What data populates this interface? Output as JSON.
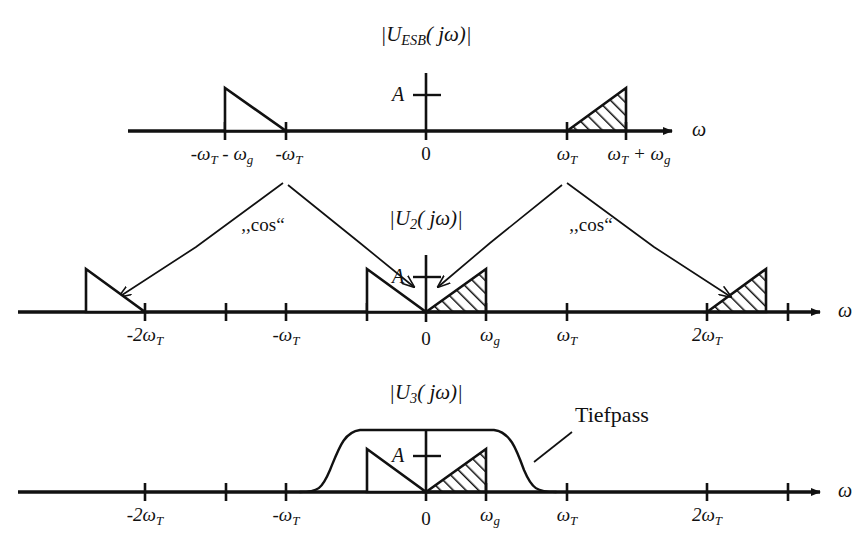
{
  "figure": {
    "kind": "signal-spectra-diagram",
    "omega_symbol": "ω",
    "ink_color": "#111111",
    "background": "#ffffff"
  },
  "panels": [
    {
      "id": "panel-esb",
      "title_main": "|U",
      "title_sub": "ESB",
      "title_tail": "( jω)|",
      "amplitude_label": "A",
      "axis_label": "ω",
      "origin_label": "0",
      "ticks": [
        {
          "label_prefix": "-ω",
          "label_sub": "T",
          "label_suffix": " - ω",
          "label_sub2": "g",
          "text": "-ωT - ωg"
        },
        {
          "label_prefix": "-ω",
          "label_sub": "T",
          "text": "-ωT"
        },
        {
          "text": "0"
        },
        {
          "label_prefix": "ω",
          "label_sub": "T",
          "text": "ωT"
        },
        {
          "label_prefix": "ω",
          "label_sub": "T",
          "label_suffix": " + ω",
          "label_sub2": "g",
          "text": "ωT + ωg"
        }
      ],
      "lobes": [
        {
          "name": "lower-sideband-negative",
          "hatched": false,
          "slope": "falling"
        },
        {
          "name": "upper-sideband-positive",
          "hatched": true,
          "slope": "rising"
        }
      ]
    },
    {
      "id": "panel-u2",
      "title_main": "|U",
      "title_sub": "2",
      "title_tail": "( jω)|",
      "amplitude_label": "A",
      "axis_label": "ω",
      "origin_label": "0",
      "mixer_label_left": ",,cos“",
      "mixer_label_right": ",,cos“",
      "ticks": [
        {
          "text": "-2ωT"
        },
        {
          "text": "-ωT"
        },
        {
          "text": "0"
        },
        {
          "text": "ωg"
        },
        {
          "text": "ωT"
        },
        {
          "text": "2ωT"
        }
      ],
      "lobes": [
        {
          "name": "image-at-minus-2wT",
          "hatched": false,
          "slope": "falling"
        },
        {
          "name": "baseband-negative",
          "hatched": false,
          "slope": "falling"
        },
        {
          "name": "baseband-positive",
          "hatched": true,
          "slope": "rising"
        },
        {
          "name": "image-at-plus-2wT",
          "hatched": true,
          "slope": "rising"
        }
      ]
    },
    {
      "id": "panel-u3",
      "title_main": "|U",
      "title_sub": "3",
      "title_tail": "( jω)|",
      "amplitude_label": "A",
      "axis_label": "ω",
      "origin_label": "0",
      "filter_label": "Tiefpass",
      "ticks": [
        {
          "text": "-2ωT"
        },
        {
          "text": "-ωT"
        },
        {
          "text": "0"
        },
        {
          "text": "ωg"
        },
        {
          "text": "ωT"
        },
        {
          "text": "2ωT"
        }
      ],
      "lobes": [
        {
          "name": "baseband-negative",
          "hatched": false,
          "slope": "falling"
        },
        {
          "name": "baseband-positive",
          "hatched": true,
          "slope": "rising"
        }
      ]
    }
  ],
  "tick_labels": {
    "minus_wT_minus_wg": {
      "a": "-ω",
      "a_sub": "T",
      "b": " - ω",
      "b_sub": "g"
    },
    "minus_wT": {
      "a": "-ω",
      "a_sub": "T"
    },
    "zero": "0",
    "wT": {
      "a": "ω",
      "a_sub": "T"
    },
    "wT_plus_wg": {
      "a": "ω",
      "a_sub": "T",
      "b": " + ω",
      "b_sub": "g"
    },
    "minus_2wT": {
      "a": "-2ω",
      "a_sub": "T"
    },
    "wg": {
      "a": "ω",
      "a_sub": "g"
    },
    "two_wT": {
      "a": "2ω",
      "a_sub": "T"
    }
  },
  "texts": {
    "cos_left": ",,cos“",
    "cos_right": ",,cos“",
    "tiefpass": "Tiefpass",
    "amplitude": "A",
    "omega": "ω",
    "zero": "0",
    "u_esb_sub": "ESB",
    "u2_sub": "2",
    "u3_sub": "3",
    "u_open": "|U",
    "u_close": "( jω)|"
  }
}
